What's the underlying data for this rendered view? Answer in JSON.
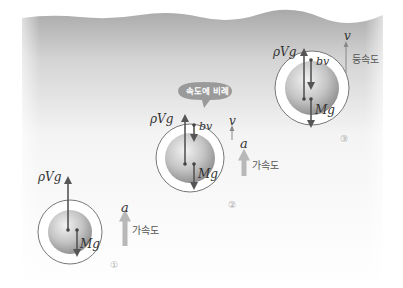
{
  "diagram": {
    "colors": {
      "water_top": "#a8a8a8",
      "water_bottom": "#ffffff",
      "arrow": "#555555",
      "accel_arrow": "#b8b8b8",
      "bubble": "#9a9a9a"
    },
    "balls": [
      {
        "id": "1",
        "stage_label": "①",
        "buoyancy_label": "ρVg",
        "weight_label": "Mg",
        "accel_label": "a",
        "accel_text": "가속도"
      },
      {
        "id": "2",
        "stage_label": "②",
        "buoyancy_label": "ρVg",
        "drag_label": "bv",
        "weight_label": "Mg",
        "velocity_label": "v",
        "accel_label": "a",
        "accel_text": "가속도",
        "callout": "속도에 비례"
      },
      {
        "id": "3",
        "stage_label": "③",
        "buoyancy_label": "ρVg",
        "drag_label": "bv",
        "weight_label": "Mg",
        "velocity_label": "v",
        "velocity_text": "등속도"
      }
    ]
  }
}
